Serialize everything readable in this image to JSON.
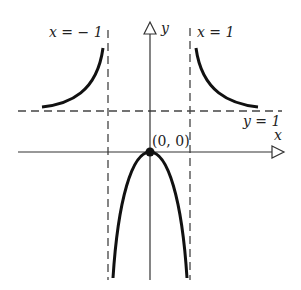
{
  "diagram": {
    "labels": {
      "x_axis": "x",
      "y_axis": "y",
      "asymptote_left": "x = − 1",
      "asymptote_right": "x = 1",
      "asymptote_horizontal": "y = 1",
      "origin_point": "(0, 0)"
    },
    "colors": {
      "curve": "#111111",
      "axis": "#333333",
      "dashed": "#444444"
    }
  }
}
